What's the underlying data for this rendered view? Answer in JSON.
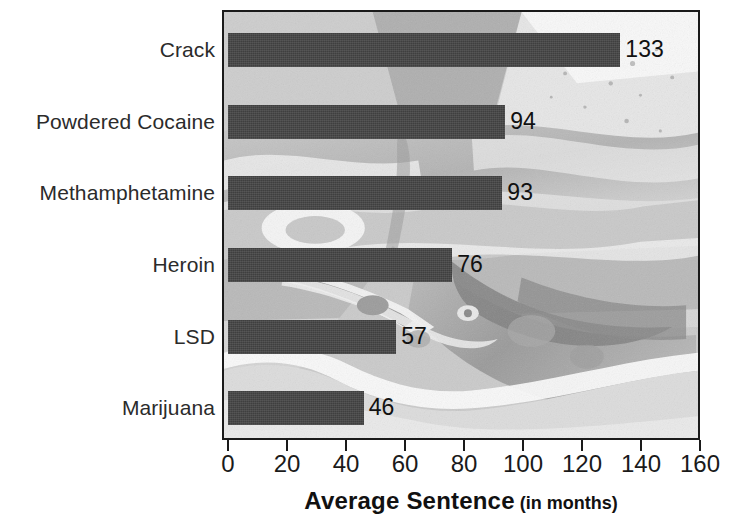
{
  "chart_data": {
    "type": "bar",
    "orientation": "horizontal",
    "title": "",
    "xlabel": "Average Sentence",
    "xlabel_suffix": "(in months)",
    "ylabel": "",
    "categories": [
      "Crack",
      "Powdered Cocaine",
      "Methamphetamine",
      "Heroin",
      "LSD",
      "Marijuana"
    ],
    "values": [
      133,
      94,
      93,
      76,
      57,
      46
    ],
    "value_labels": [
      "133",
      "94",
      "93",
      "76",
      "57",
      "46"
    ],
    "xlim": [
      0,
      160
    ],
    "xticks": [
      0,
      20,
      40,
      60,
      80,
      100,
      120,
      140,
      160
    ],
    "xtick_labels": [
      "0",
      "20",
      "40",
      "60",
      "80",
      "100",
      "120",
      "140",
      "160"
    ],
    "grid": false,
    "legend": null,
    "bar_color": "#3f3f3f",
    "plot_border_color": "#1a1a1a",
    "background": "grayscale-photograph",
    "text_color": "#1a1a1a"
  },
  "axis": {
    "title_main": "Average Sentence",
    "title_sub": "(in months)"
  }
}
